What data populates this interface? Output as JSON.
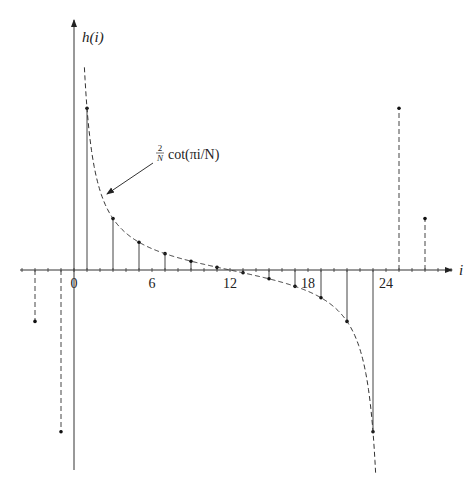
{
  "chart_data": {
    "type": "stem",
    "title": "",
    "ylabel": "h(i)",
    "xlabel": "i",
    "x_tick_labels": [
      "0",
      "6",
      "12",
      "18",
      "24"
    ],
    "x_ticks": [
      0,
      6,
      12,
      18,
      24
    ],
    "xlim": [
      -4,
      29
    ],
    "annotation": {
      "text_frac_num": "2",
      "text_frac_den": "N",
      "text_rest": "cot(πi/N)",
      "points_to": "dashed curve"
    },
    "N": 24,
    "series": [
      {
        "name": "h(i) primary period (solid stems)",
        "style": "solid",
        "x": [
          1,
          3,
          5,
          7,
          9,
          11,
          13,
          15,
          17,
          19,
          21,
          23
        ],
        "values": [
          7.596,
          2.414,
          1.303,
          0.767,
          0.414,
          0.132,
          -0.132,
          -0.414,
          -0.767,
          -1.303,
          -2.414,
          -7.596
        ]
      },
      {
        "name": "h(i) periodic extension (dashed stems)",
        "style": "dashed",
        "x": [
          -3,
          -1,
          25,
          27
        ],
        "values": [
          -2.414,
          -7.596,
          7.596,
          2.414
        ]
      },
      {
        "name": "(2/N) cot(πi/N) envelope",
        "style": "dashed-curve",
        "x_range": [
          0.8,
          23.2
        ]
      }
    ],
    "grid": false,
    "legend": null
  },
  "labels": {
    "y_axis": "h(i)",
    "x_axis": "i",
    "tick_0": "0",
    "tick_6": "6",
    "tick_12": "12",
    "tick_18": "18",
    "tick_24": "24",
    "ann_num": "2",
    "ann_den": "N",
    "ann_rest": "cot(πi/N)"
  }
}
